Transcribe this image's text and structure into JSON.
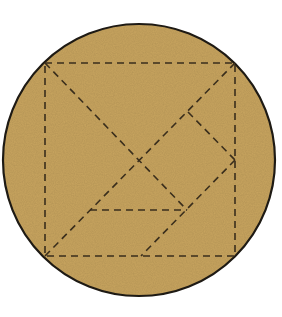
{
  "diagram": {
    "colors": {
      "fill": "#c9a55f",
      "outline": "#1e1a14",
      "dash": "#3a2e1c",
      "background": "#ffffff"
    },
    "circle": {
      "cx": 139,
      "cy": 160,
      "r": 136
    },
    "square": {
      "x1": 45,
      "y1": 63,
      "x2": 235,
      "y2": 256
    },
    "dash_pattern": "7 5",
    "lines": [
      {
        "name": "diagonal-top-left-to-mid",
        "x1": 45,
        "y1": 63,
        "x2": 187,
        "y2": 210
      },
      {
        "name": "diagonal-bottom-left-to-top-right",
        "x1": 45,
        "y1": 256,
        "x2": 235,
        "y2": 63
      },
      {
        "name": "small-triangle-edge",
        "x1": 188,
        "y1": 112,
        "x2": 235,
        "y2": 160
      },
      {
        "name": "parallelogram-edge-right",
        "x1": 235,
        "y1": 160,
        "x2": 141,
        "y2": 256
      },
      {
        "name": "horizontal-mid-edge",
        "x1": 90,
        "y1": 210,
        "x2": 187,
        "y2": 210
      }
    ]
  }
}
